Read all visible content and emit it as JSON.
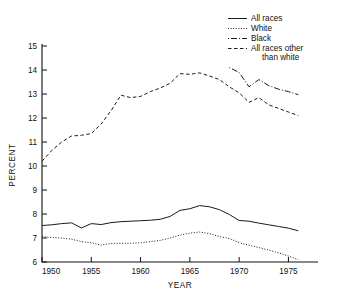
{
  "chart_data": {
    "type": "line",
    "title": "",
    "xlabel": "YEAR",
    "ylabel": "PERCENT",
    "xlim": [
      1950,
      1978
    ],
    "ylim": [
      6,
      15
    ],
    "xticks": [
      1950,
      1955,
      1960,
      1965,
      1970,
      1975
    ],
    "xtick_labels": [
      "1950",
      "1955",
      "1960",
      "1965",
      "1970",
      "1975"
    ],
    "yticks": [
      6,
      7,
      8,
      9,
      10,
      11,
      12,
      13,
      14,
      15
    ],
    "ytick_labels": [
      "6",
      "7",
      "8",
      "9",
      "10",
      "11",
      "12",
      "13",
      "14",
      "15"
    ],
    "grid": false,
    "legend_position": "top-right",
    "series": [
      {
        "name": "All races",
        "style": "solid",
        "x": [
          1950,
          1951,
          1952,
          1953,
          1954,
          1955,
          1956,
          1957,
          1958,
          1959,
          1960,
          1961,
          1962,
          1963,
          1964,
          1965,
          1966,
          1967,
          1968,
          1969,
          1970,
          1971,
          1972,
          1973,
          1974,
          1975,
          1976
        ],
        "values": [
          7.52,
          7.55,
          7.6,
          7.63,
          7.42,
          7.6,
          7.56,
          7.64,
          7.68,
          7.7,
          7.72,
          7.74,
          7.78,
          7.9,
          8.15,
          8.22,
          8.35,
          8.3,
          8.18,
          7.98,
          7.73,
          7.7,
          7.62,
          7.55,
          7.48,
          7.41,
          7.3
        ]
      },
      {
        "name": "White",
        "style": "dotted",
        "x": [
          1950,
          1951,
          1952,
          1953,
          1954,
          1955,
          1956,
          1957,
          1958,
          1959,
          1960,
          1961,
          1962,
          1963,
          1964,
          1965,
          1966,
          1967,
          1968,
          1969,
          1970,
          1971,
          1972,
          1973,
          1974,
          1975,
          1976
        ],
        "values": [
          7.06,
          7.02,
          7.0,
          6.95,
          6.85,
          6.8,
          6.7,
          6.78,
          6.78,
          6.78,
          6.8,
          6.85,
          6.9,
          7.0,
          7.12,
          7.2,
          7.25,
          7.18,
          7.06,
          6.98,
          6.81,
          6.7,
          6.6,
          6.5,
          6.38,
          6.25,
          6.1
        ]
      },
      {
        "name": "Black",
        "style": "dashdot",
        "x": [
          1969,
          1970,
          1971,
          1972,
          1973,
          1974,
          1975,
          1976
        ],
        "values": [
          14.1,
          13.9,
          13.3,
          13.6,
          13.35,
          13.2,
          13.1,
          12.97
        ]
      },
      {
        "name": "All races other than white",
        "style": "dashed",
        "x": [
          1950,
          1951,
          1952,
          1953,
          1954,
          1955,
          1956,
          1957,
          1958,
          1959,
          1960,
          1961,
          1962,
          1963,
          1964,
          1965,
          1966,
          1967,
          1968,
          1969,
          1970,
          1971,
          1972,
          1973,
          1974,
          1975,
          1976
        ],
        "values": [
          10.2,
          10.65,
          11.0,
          11.25,
          11.28,
          11.35,
          11.75,
          12.3,
          12.95,
          12.85,
          12.9,
          13.1,
          13.25,
          13.45,
          13.85,
          13.82,
          13.88,
          13.75,
          13.6,
          13.3,
          13.05,
          12.65,
          12.85,
          12.55,
          12.4,
          12.25,
          12.1
        ]
      }
    ]
  },
  "legend": {
    "entries": [
      {
        "label": "All races"
      },
      {
        "label": "White"
      },
      {
        "label": "Black"
      },
      {
        "label": "All races other"
      },
      {
        "label": "than white"
      }
    ]
  },
  "colors": {
    "line": "#1a1a1a",
    "axis": "#111111",
    "background": "#ffffff"
  }
}
